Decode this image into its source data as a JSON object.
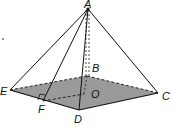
{
  "diagram": {
    "type": "square pyramid",
    "base_fill": "#9a9a9a",
    "stray_dot": ".",
    "vertices": {
      "A": {
        "label": "A",
        "x": 88,
        "y": 9
      },
      "B": {
        "label": "B",
        "x": 87,
        "y": 76
      },
      "C": {
        "label": "C",
        "x": 158,
        "y": 93
      },
      "D": {
        "label": "D",
        "x": 79,
        "y": 110
      },
      "E": {
        "label": "E",
        "x": 10,
        "y": 90
      },
      "F": {
        "label": "F",
        "x": 43,
        "y": 101
      },
      "O": {
        "label": "O",
        "x": 84,
        "y": 94
      }
    }
  }
}
